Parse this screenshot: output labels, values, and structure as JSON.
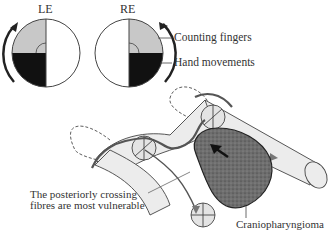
{
  "figure": {
    "fields": [
      {
        "eye": "LE",
        "quadrant_upper": "counting-fingers",
        "quadrant_lower": "hand-movements",
        "side": "left"
      },
      {
        "eye": "RE",
        "quadrant_upper": "counting-fingers",
        "quadrant_lower": "hand-movements",
        "side": "right"
      }
    ],
    "labels": {
      "le": "LE",
      "re": "RE",
      "counting_fingers": "Counting fingers",
      "hand_movements": "Hand movements",
      "posterior_line1": "The posteriorly crossing",
      "posterior_line2": "fibres are most vulnerable",
      "tumour": "Craniopharyngioma"
    },
    "colors": {
      "counting_fingers_fill": "#c8c8c8",
      "hand_movements_fill": "#111111",
      "nerve_fill": "#ececec",
      "tumour_fill": "#6a6a6a",
      "outline": "#444444"
    }
  }
}
